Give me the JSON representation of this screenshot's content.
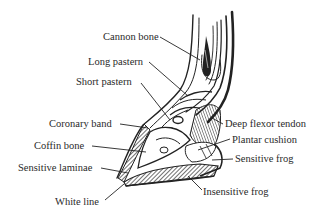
{
  "diagram": {
    "colors": {
      "ink": "#222222",
      "background": "#ffffff"
    },
    "labels": [
      {
        "id": "cannon-bone",
        "text": "Cannon bone",
        "x": 103,
        "y": 31
      },
      {
        "id": "long-pastern",
        "text": "Long pastern",
        "x": 88,
        "y": 54
      },
      {
        "id": "short-pastern",
        "text": "Short pastern",
        "x": 76,
        "y": 75
      },
      {
        "id": "coronary-band",
        "text": "Coronary band",
        "x": 49,
        "y": 118
      },
      {
        "id": "coffin-bone",
        "text": "Coffin bone",
        "x": 34,
        "y": 140
      },
      {
        "id": "sensitive-laminae",
        "text": "Sensitive laminae",
        "x": 18,
        "y": 162
      },
      {
        "id": "white-line",
        "text": "White line",
        "x": 55,
        "y": 196
      },
      {
        "id": "deep-flexor-tendon",
        "text": "Deep flexor tendon",
        "x": 225,
        "y": 119
      },
      {
        "id": "plantar-cushion",
        "text": "Plantar cushion",
        "x": 232,
        "y": 134
      },
      {
        "id": "sensitive-frog",
        "text": "Sensitive frog",
        "x": 235,
        "y": 154
      },
      {
        "id": "insensitive-frog",
        "text": "Insensitive frog",
        "x": 203,
        "y": 185
      }
    ]
  }
}
